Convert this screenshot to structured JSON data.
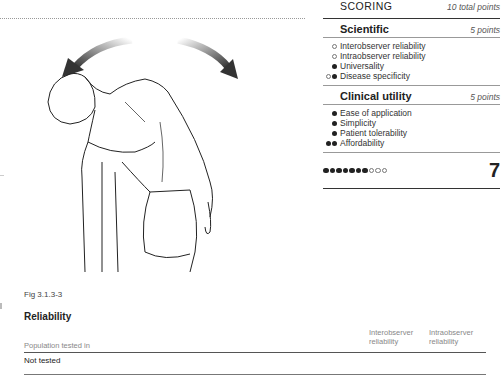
{
  "figure": {
    "caption": "Fig 3.1.3-3",
    "illustration": "person-lateral-trunk-flexion-with-rotation-arrows"
  },
  "scoring": {
    "title": "SCORING",
    "total_points_label": "10 total points",
    "sections": [
      {
        "title": "Scientific",
        "points_label": "5 points",
        "items": [
          {
            "label": "Interobserver reliability",
            "dots": [
              "empty"
            ]
          },
          {
            "label": "Intraobserver reliability",
            "dots": [
              "empty"
            ]
          },
          {
            "label": "Universality",
            "dots": [
              "full"
            ]
          },
          {
            "label": "Disease specificity",
            "dots": [
              "empty",
              "full"
            ]
          }
        ]
      },
      {
        "title": "Clinical utility",
        "points_label": "5 points",
        "items": [
          {
            "label": "Ease of application",
            "dots": [
              "full"
            ]
          },
          {
            "label": "Simplicity",
            "dots": [
              "full"
            ]
          },
          {
            "label": "Patient tolerability",
            "dots": [
              "full"
            ]
          },
          {
            "label": "Affordability",
            "dots": [
              "full",
              "full"
            ]
          }
        ]
      }
    ],
    "total": {
      "score": "7",
      "filled": 7,
      "max": 10
    }
  },
  "reliability": {
    "title": "Reliability",
    "columns": [
      "Population tested in",
      "Interobserver reliability",
      "Intraobserver reliability"
    ],
    "rows": [
      [
        "Not tested",
        "",
        ""
      ]
    ]
  }
}
